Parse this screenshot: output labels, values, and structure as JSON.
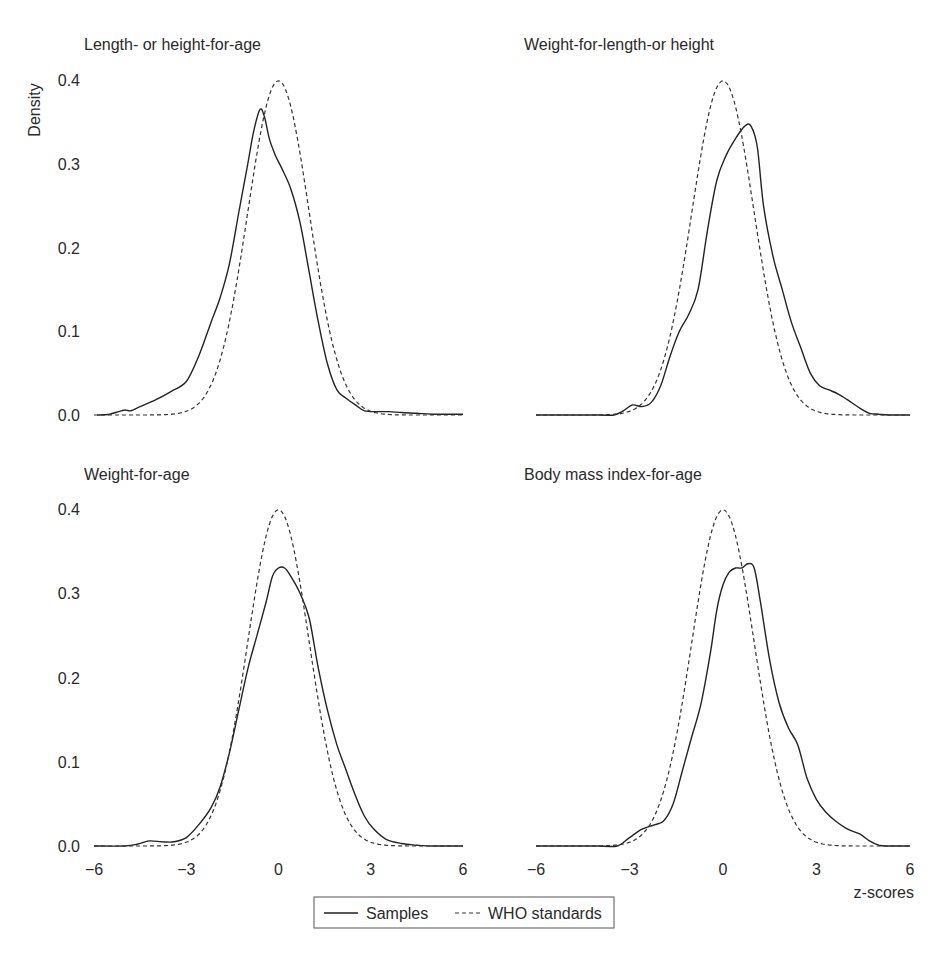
{
  "chart_data": [
    {
      "type": "line",
      "title": "Length- or height-for-age",
      "xlabel": "",
      "ylabel": "Density",
      "xlim": [
        -6,
        6
      ],
      "ylim": [
        0,
        0.4
      ],
      "yticks": [
        "0.0",
        "0.1",
        "0.2",
        "0.3",
        "0.4"
      ],
      "xticks": [],
      "series": [
        {
          "name": "Samples",
          "style": "solid",
          "x": [
            -5.9,
            -5.5,
            -5.2,
            -5.0,
            -4.8,
            -4.5,
            -4.0,
            -3.5,
            -3.0,
            -2.6,
            -2.2,
            -1.9,
            -1.6,
            -1.3,
            -1.0,
            -0.8,
            -0.6,
            -0.45,
            -0.3,
            -0.1,
            0.1,
            0.4,
            0.7,
            1.0,
            1.3,
            1.6,
            1.9,
            2.2,
            2.5,
            2.8,
            3.2,
            3.6,
            4.0,
            4.5,
            5.0,
            5.5,
            6.0
          ],
          "y": [
            0.0,
            0.001,
            0.004,
            0.006,
            0.005,
            0.01,
            0.018,
            0.028,
            0.04,
            0.07,
            0.11,
            0.14,
            0.18,
            0.24,
            0.3,
            0.34,
            0.365,
            0.355,
            0.33,
            0.31,
            0.295,
            0.27,
            0.23,
            0.17,
            0.11,
            0.06,
            0.03,
            0.02,
            0.012,
            0.005,
            0.004,
            0.004,
            0.003,
            0.002,
            0.001,
            0.001,
            0.001
          ]
        },
        {
          "name": "WHO standards",
          "style": "dashed",
          "distribution": "standard normal"
        }
      ]
    },
    {
      "type": "line",
      "title": "Weight-for-length-or height",
      "xlabel": "",
      "ylabel": "",
      "xlim": [
        -6,
        6
      ],
      "ylim": [
        0,
        0.4
      ],
      "yticks": [],
      "xticks": [],
      "series": [
        {
          "name": "Samples",
          "style": "solid",
          "x": [
            -6.0,
            -4.0,
            -3.5,
            -3.2,
            -2.9,
            -2.6,
            -2.3,
            -2.0,
            -1.7,
            -1.4,
            -1.1,
            -0.8,
            -0.5,
            -0.2,
            0.1,
            0.4,
            0.7,
            0.9,
            1.1,
            1.3,
            1.6,
            1.9,
            2.2,
            2.5,
            2.8,
            3.1,
            3.4,
            3.7,
            4.0,
            4.4,
            4.7,
            5.0,
            5.3,
            6.0
          ],
          "y": [
            0.0,
            0.0,
            0.0,
            0.005,
            0.012,
            0.01,
            0.015,
            0.035,
            0.07,
            0.1,
            0.12,
            0.15,
            0.22,
            0.28,
            0.31,
            0.33,
            0.345,
            0.345,
            0.32,
            0.25,
            0.19,
            0.15,
            0.11,
            0.08,
            0.05,
            0.035,
            0.03,
            0.025,
            0.018,
            0.008,
            0.002,
            0.001,
            0.0,
            0.0
          ]
        },
        {
          "name": "WHO standards",
          "style": "dashed",
          "distribution": "standard normal"
        }
      ]
    },
    {
      "type": "line",
      "title": "Weight-for-age",
      "xlabel": "",
      "ylabel": "",
      "xlim": [
        -6,
        6
      ],
      "ylim": [
        0,
        0.4
      ],
      "yticks": [
        "0.0",
        "0.1",
        "0.2",
        "0.3",
        "0.4"
      ],
      "xticks": [
        "−6",
        "−3",
        "0",
        "3",
        "6"
      ],
      "series": [
        {
          "name": "Samples",
          "style": "solid",
          "x": [
            -6.0,
            -5.0,
            -4.6,
            -4.2,
            -3.8,
            -3.4,
            -3.0,
            -2.6,
            -2.2,
            -1.9,
            -1.6,
            -1.3,
            -1.0,
            -0.7,
            -0.4,
            -0.2,
            0.0,
            0.2,
            0.4,
            0.7,
            1.0,
            1.3,
            1.6,
            1.9,
            2.2,
            2.5,
            2.8,
            3.1,
            3.5,
            4.0,
            4.5,
            5.0,
            6.0
          ],
          "y": [
            0.0,
            0.0,
            0.002,
            0.006,
            0.005,
            0.005,
            0.01,
            0.025,
            0.045,
            0.07,
            0.11,
            0.16,
            0.21,
            0.25,
            0.29,
            0.32,
            0.33,
            0.33,
            0.32,
            0.3,
            0.27,
            0.21,
            0.16,
            0.12,
            0.09,
            0.06,
            0.035,
            0.02,
            0.008,
            0.003,
            0.001,
            0.0,
            0.0
          ]
        },
        {
          "name": "WHO standards",
          "style": "dashed",
          "distribution": "standard normal"
        }
      ]
    },
    {
      "type": "line",
      "title": "Body mass index-for-age",
      "xlabel": "z-scores",
      "ylabel": "",
      "xlim": [
        -6,
        6
      ],
      "ylim": [
        0,
        0.4
      ],
      "yticks": [],
      "xticks": [
        "−6",
        "−3",
        "0",
        "3",
        "6"
      ],
      "series": [
        {
          "name": "Samples",
          "style": "solid",
          "x": [
            -6.0,
            -4.0,
            -3.4,
            -3.0,
            -2.6,
            -2.2,
            -1.9,
            -1.6,
            -1.3,
            -1.0,
            -0.7,
            -0.4,
            -0.2,
            0.0,
            0.2,
            0.4,
            0.6,
            0.8,
            1.0,
            1.2,
            1.5,
            1.8,
            2.1,
            2.4,
            2.7,
            3.0,
            3.3,
            3.6,
            4.0,
            4.4,
            4.7,
            5.0,
            5.3,
            6.0
          ],
          "y": [
            0.0,
            0.0,
            0.0,
            0.01,
            0.02,
            0.025,
            0.03,
            0.05,
            0.09,
            0.13,
            0.17,
            0.23,
            0.28,
            0.31,
            0.325,
            0.33,
            0.33,
            0.335,
            0.33,
            0.29,
            0.22,
            0.17,
            0.14,
            0.12,
            0.08,
            0.055,
            0.04,
            0.03,
            0.02,
            0.014,
            0.006,
            0.001,
            0.0,
            0.0
          ]
        },
        {
          "name": "WHO standards",
          "style": "dashed",
          "distribution": "standard normal"
        }
      ]
    }
  ],
  "legend": {
    "position": "bottom-center",
    "entries": [
      {
        "label": "Samples",
        "style": "solid"
      },
      {
        "label": "WHO standards",
        "style": "dashed"
      }
    ]
  }
}
